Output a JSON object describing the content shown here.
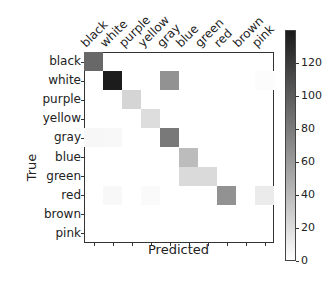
{
  "chart_data": {
    "type": "heatmap",
    "title": "",
    "xlabel": "Predicted",
    "ylabel": "True",
    "x_categories": [
      "black",
      "white",
      "purple",
      "yellow",
      "gray",
      "blue",
      "green",
      "red",
      "brown",
      "pink"
    ],
    "y_categories": [
      "black",
      "white",
      "purple",
      "yellow",
      "gray",
      "blue",
      "green",
      "red",
      "brown",
      "pink"
    ],
    "values": [
      [
        90,
        0,
        0,
        0,
        0,
        0,
        0,
        0,
        0,
        0
      ],
      [
        0,
        135,
        0,
        0,
        65,
        0,
        0,
        0,
        0,
        2
      ],
      [
        0,
        0,
        25,
        0,
        0,
        0,
        0,
        0,
        0,
        0
      ],
      [
        0,
        0,
        0,
        20,
        0,
        0,
        0,
        0,
        0,
        0
      ],
      [
        5,
        4,
        0,
        0,
        80,
        0,
        0,
        0,
        0,
        0
      ],
      [
        0,
        0,
        0,
        0,
        0,
        40,
        0,
        0,
        0,
        0
      ],
      [
        0,
        0,
        0,
        0,
        0,
        22,
        22,
        0,
        0,
        0
      ],
      [
        0,
        4,
        0,
        3,
        0,
        0,
        0,
        65,
        0,
        12
      ],
      [
        0,
        0,
        0,
        0,
        0,
        0,
        0,
        0,
        0,
        0
      ],
      [
        0,
        0,
        0,
        0,
        0,
        0,
        0,
        0,
        0,
        0
      ]
    ],
    "colorbar": {
      "min": 0,
      "max": 140,
      "ticks": [
        0,
        20,
        40,
        60,
        80,
        100,
        120
      ],
      "colormap": "Greys"
    },
    "grid": false,
    "legend": "colorbar-right"
  }
}
